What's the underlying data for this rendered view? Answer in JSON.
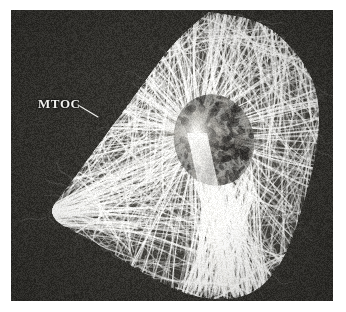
{
  "figure": {
    "type": "fluorescence-micrograph",
    "background_color": "#ffffff",
    "plate": {
      "x": 11,
      "y": 10,
      "width": 322,
      "height": 291,
      "background_color": "#34332f",
      "dark_tone": "#2e2d2a",
      "bright_tone": "#fdfdfb",
      "mid_tone": "#8d8b85"
    }
  },
  "annotations": [
    {
      "id": "mtoc",
      "label": "MTOC",
      "text_color": "#f2f2ef",
      "label_x": 38,
      "label_y": 97,
      "leader_from": {
        "x": 78,
        "y": 105
      },
      "leader_to": {
        "x": 98,
        "y": 117
      },
      "leader_color": "#f2f2ef"
    }
  ],
  "cell": {
    "shape": "kite",
    "outline_points": [
      [
        208,
        14
      ],
      [
        262,
        22
      ],
      [
        300,
        58
      ],
      [
        318,
        96
      ],
      [
        316,
        150
      ],
      [
        300,
        210
      ],
      [
        282,
        262
      ],
      [
        250,
        296
      ],
      [
        200,
        298
      ],
      [
        150,
        276
      ],
      [
        96,
        240
      ],
      [
        46,
        216
      ],
      [
        70,
        186
      ],
      [
        104,
        140
      ],
      [
        140,
        92
      ],
      [
        172,
        46
      ]
    ],
    "mtoc_focus": {
      "x": 196,
      "y": 133,
      "radius": 22
    },
    "nucleus": {
      "cx": 214,
      "cy": 140,
      "rx": 40,
      "ry": 46
    }
  },
  "chart_data": {
    "type": "heatmap",
    "title": "",
    "xlabel": "",
    "ylabel": ""
  }
}
